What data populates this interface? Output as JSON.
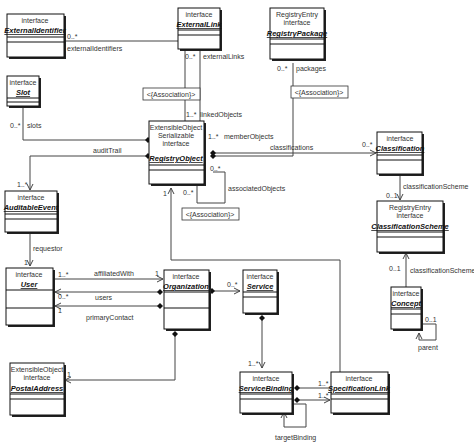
{
  "diagram": {
    "type": "UML class diagram",
    "classes": {
      "externalIdentifier": {
        "stereotypes": [
          "interface"
        ],
        "name": "ExternalIdentifier"
      },
      "externalLink": {
        "stereotypes": [
          "interface"
        ],
        "name": "ExternalLink"
      },
      "registryPackage": {
        "stereotypes": [
          "RegistryEntry",
          "interface"
        ],
        "name": "RegistryPackage"
      },
      "slot": {
        "stereotypes": [
          "interface"
        ],
        "name": "Slot"
      },
      "registryObject": {
        "stereotypes": [
          "ExtensibleObject",
          "Serializable",
          "interface"
        ],
        "name": "RegistryObject"
      },
      "classification": {
        "stereotypes": [
          "interface"
        ],
        "name": "Classification"
      },
      "auditableEvent": {
        "stereotypes": [
          "interface"
        ],
        "name": "AuditableEvent"
      },
      "classificationScheme": {
        "stereotypes": [
          "RegistryEntry",
          "interface"
        ],
        "name": "ClassificationScheme"
      },
      "user": {
        "stereotypes": [
          "interface"
        ],
        "name": "User"
      },
      "organization": {
        "stereotypes": [
          "interface"
        ],
        "name": "Organization"
      },
      "service": {
        "stereotypes": [
          "interface"
        ],
        "name": "Service"
      },
      "concept": {
        "stereotypes": [
          "interface"
        ],
        "name": "Concept"
      },
      "postalAddress": {
        "stereotypes": [
          "ExtensibleObject",
          "interface"
        ],
        "name": "PostalAddress"
      },
      "serviceBinding": {
        "stereotypes": [
          "interface"
        ],
        "name": "ServiceBinding"
      },
      "specificationLink": {
        "stereotypes": [
          "interface"
        ],
        "name": "SpecificationLink"
      }
    },
    "associations": {
      "externalIdentifiers": {
        "role": "externalIdentifiers",
        "mult": "0..*"
      },
      "externalLinks": {
        "role": "externalLinks",
        "mult": "0..*"
      },
      "linkedObjects": {
        "role": "linkedObjects",
        "mult": "1..*"
      },
      "packages": {
        "role": "packages",
        "mult": "0..*"
      },
      "memberObjects": {
        "role": "memberObjects",
        "mult": "1..*"
      },
      "slots": {
        "role": "slots",
        "mult": "0..*"
      },
      "auditTrail": {
        "role": "auditTrail",
        "mult": "1..*"
      },
      "classifications": {
        "role": "classifications",
        "mult": "0..*"
      },
      "associatedObjects": {
        "role": "associatedObjects",
        "mult_a": "0..*",
        "mult_b": "0..*"
      },
      "classificationScheme1": {
        "role": "classificationScheme",
        "mult": "0..1"
      },
      "classificationScheme2": {
        "role": "classificationScheme",
        "mult": "0..1"
      },
      "requestor": {
        "role": "requestor",
        "mult": "1"
      },
      "registryObjectInherit": {
        "mult": "1"
      },
      "affiliatedWith": {
        "role": "affiliatedWith",
        "mult_a": "1..*",
        "mult_b": "1"
      },
      "users": {
        "role": "users",
        "mult": "0..*"
      },
      "primaryContact": {
        "role": "primaryContact",
        "mult": "1"
      },
      "services": {
        "mult": "0..*"
      },
      "serviceBindings": {
        "mult": "1..*"
      },
      "postalAddress": {
        "mult": "1"
      },
      "parent": {
        "role": "parent",
        "mult": "0..1"
      },
      "specLinks1": {
        "mult": "1..*"
      },
      "specLinks2": {
        "mult": "1..*"
      },
      "targetBinding": {
        "role": "targetBinding"
      }
    },
    "association_class_label": "<{Association}>"
  }
}
